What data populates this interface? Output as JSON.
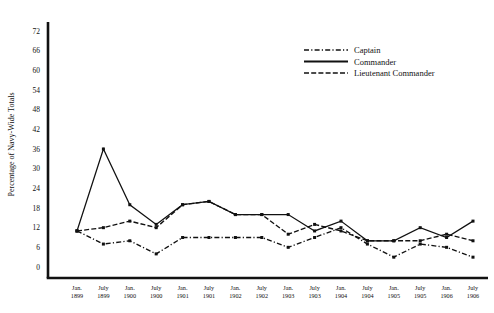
{
  "chart_data": {
    "type": "line",
    "title": "",
    "xlabel": "",
    "ylabel": "Percentage of Navy-Wide Totals",
    "ylim": [
      0,
      72
    ],
    "ytick_step": 6,
    "yticks": [
      0,
      6,
      12,
      18,
      24,
      30,
      36,
      42,
      48,
      54,
      60,
      66,
      72
    ],
    "grid": false,
    "legend_position": "top-right",
    "categories": [
      "Jan. 1899",
      "July 1899",
      "Jan. 1900",
      "July 1900",
      "Jan. 1901",
      "July 1901",
      "Jan. 1902",
      "July 1902",
      "Jan. 1903",
      "July 1903",
      "Jan. 1904",
      "July 1904",
      "Jan. 1905",
      "July 1905",
      "Jan. 1906",
      "July 1906"
    ],
    "category_lines": [
      [
        "Jan.",
        "1899"
      ],
      [
        "July",
        "1899"
      ],
      [
        "Jan.",
        "1900"
      ],
      [
        "July",
        "1900"
      ],
      [
        "Jan.",
        "1901"
      ],
      [
        "July",
        "1901"
      ],
      [
        "Jan.",
        "1902"
      ],
      [
        "July",
        "1902"
      ],
      [
        "Jan.",
        "1903"
      ],
      [
        "July",
        "1903"
      ],
      [
        "Jan.",
        "1904"
      ],
      [
        "July",
        "1904"
      ],
      [
        "Jan.",
        "1905"
      ],
      [
        "July",
        "1905"
      ],
      [
        "Jan.",
        "1906"
      ],
      [
        "July",
        "1906"
      ]
    ],
    "series": [
      {
        "name": "Captain",
        "style": "dashdot",
        "color": "#111111",
        "values": [
          11,
          7,
          8,
          4,
          9,
          9,
          9,
          9,
          6,
          9,
          12,
          7,
          3,
          7,
          6,
          3
        ]
      },
      {
        "name": "Commander",
        "style": "solid",
        "color": "#111111",
        "values": [
          11,
          36,
          19,
          13,
          19,
          20,
          16,
          16,
          16,
          11,
          14,
          8,
          8,
          12,
          9,
          14
        ]
      },
      {
        "name": "Lieutenant Commander",
        "style": "dashed",
        "color": "#111111",
        "values": [
          11,
          12,
          14,
          12,
          19,
          20,
          16,
          16,
          10,
          13,
          11,
          8,
          8,
          8,
          10,
          8
        ]
      }
    ]
  },
  "legend": {
    "items": [
      {
        "label": "Captain",
        "style": "dashdot"
      },
      {
        "label": "Commander",
        "style": "solid"
      },
      {
        "label": "Lieutenant Commander",
        "style": "dashed"
      }
    ]
  },
  "axes": {
    "y_title": "Percentage of Navy-Wide Totals"
  }
}
